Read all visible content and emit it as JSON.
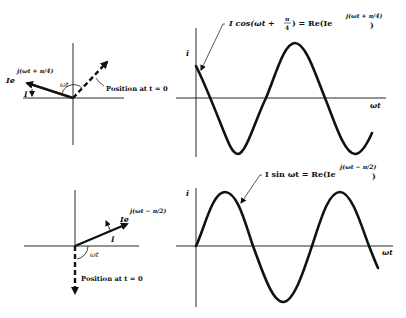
{
  "top": {
    "phasor": {
      "phasor_label_base": "Ie",
      "phasor_label_exp": "j(ωt + π/4)",
      "magnitude_label": "I",
      "angle_label": "ωt",
      "position_label": "Position at t = 0"
    },
    "graph": {
      "y_axis_label": "i",
      "x_axis_label": "ωt",
      "equation_left": "I cos(ωt + ",
      "equation_frac_num": "π",
      "equation_frac_den": "4",
      "equation_mid": ") = Re(Ie",
      "equation_exp": "j(ωt + π/4)",
      "equation_right": ")"
    }
  },
  "bottom": {
    "phasor": {
      "phasor_label_base": "Ie",
      "phasor_label_exp": "j(ωt − π/2)",
      "magnitude_label": "I",
      "angle_label": "ωt",
      "position_label": "Position at t = 0"
    },
    "graph": {
      "y_axis_label": "i",
      "x_axis_label": "ωt",
      "equation_left": "I sin ωt = Re(Ie",
      "equation_exp": "j(ωt − π/2)",
      "equation_right": ")"
    }
  },
  "colors": {
    "ink": "#111111",
    "background": "#ffffff"
  }
}
